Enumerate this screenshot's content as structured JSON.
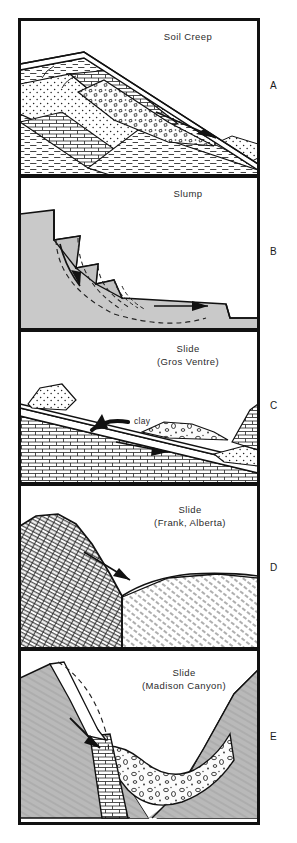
{
  "figure": {
    "type": "geologic-cross-section-series",
    "frame": {
      "border_color": "#111111",
      "background": "#ffffff"
    },
    "panels": [
      {
        "letter": "A",
        "title": "Soil Creep",
        "title_line2": "",
        "label_clay": "",
        "description": "Tilted sedimentary layers with surface soil creeping downslope",
        "arrow": "downslope-right",
        "units": [
          "stipple-sandstone",
          "brick-limestone",
          "dash-shale",
          "rubble-colluvium"
        ]
      },
      {
        "letter": "B",
        "title": "Slump",
        "title_line2": "",
        "label_clay": "",
        "description": "Rotational slump blocks with curved dashed failure surfaces",
        "arrow": "rotational-down-and-outward",
        "units": [
          "gray-regolith"
        ]
      },
      {
        "letter": "C",
        "title": "Slide",
        "title_line2": "(Gros Ventre)",
        "label_clay": "clay",
        "description": "Bedding-plane slide above a clay layer",
        "arrow": "downslope-right",
        "units": [
          "brick-limestone",
          "stipple-sandstone",
          "clay-seam",
          "rubble-debris"
        ]
      },
      {
        "letter": "D",
        "title": "Slide",
        "title_line2": "(Frank, Alberta)",
        "label_clay": "",
        "description": "Rockslide of cross-hatched limestone over weaker shale",
        "arrow": "downslope-right",
        "units": [
          "crosshatch-limestone",
          "diagonal-shale"
        ]
      },
      {
        "letter": "E",
        "title": "Slide",
        "title_line2": "(Madison Canyon)",
        "label_clay": "",
        "description": "Valley-wall rockslide filling a V-shaped canyon with debris",
        "arrow": "downslope-right-steep",
        "units": [
          "gray-bedrock",
          "brick-rock-unit",
          "rubble-slide-debris"
        ]
      }
    ],
    "colors": {
      "ink": "#111111",
      "text": "#2b2b2b",
      "gray_fill": "#b9b9b9",
      "light_fill": "#f2f2f2",
      "white": "#ffffff"
    }
  }
}
